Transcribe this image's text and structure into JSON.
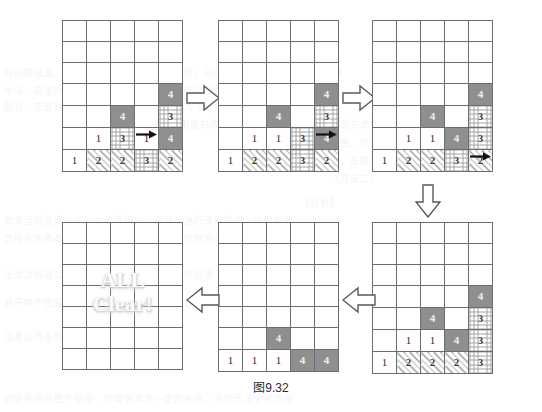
{
  "figure": {
    "caption_cjk": "图",
    "caption_number": "9.32",
    "all_clear_text": "ALL\nClear!"
  },
  "grid_spec": {
    "columns": 5,
    "rows": 7,
    "cell_types": [
      "empty",
      "plain",
      "solid",
      "diag",
      "cross"
    ]
  },
  "panels": [
    {
      "id": "panel-1",
      "name": "step-1-initial",
      "rows": [
        [
          {
            "t": "empty",
            "v": ""
          },
          {
            "t": "empty",
            "v": ""
          },
          {
            "t": "empty",
            "v": ""
          },
          {
            "t": "empty",
            "v": ""
          },
          {
            "t": "empty",
            "v": ""
          }
        ],
        [
          {
            "t": "empty",
            "v": ""
          },
          {
            "t": "empty",
            "v": ""
          },
          {
            "t": "empty",
            "v": ""
          },
          {
            "t": "empty",
            "v": ""
          },
          {
            "t": "empty",
            "v": ""
          }
        ],
        [
          {
            "t": "empty",
            "v": ""
          },
          {
            "t": "empty",
            "v": ""
          },
          {
            "t": "empty",
            "v": ""
          },
          {
            "t": "empty",
            "v": ""
          },
          {
            "t": "empty",
            "v": ""
          }
        ],
        [
          {
            "t": "empty",
            "v": ""
          },
          {
            "t": "empty",
            "v": ""
          },
          {
            "t": "empty",
            "v": ""
          },
          {
            "t": "empty",
            "v": ""
          },
          {
            "t": "solid",
            "v": "4"
          }
        ],
        [
          {
            "t": "empty",
            "v": ""
          },
          {
            "t": "empty",
            "v": ""
          },
          {
            "t": "solid",
            "v": "4"
          },
          {
            "t": "empty",
            "v": ""
          },
          {
            "t": "cross",
            "v": "3"
          }
        ],
        [
          {
            "t": "empty",
            "v": ""
          },
          {
            "t": "plain",
            "v": "1"
          },
          {
            "t": "cross",
            "v": "3"
          },
          {
            "t": "plain",
            "v": "1"
          },
          {
            "t": "solid",
            "v": "4"
          }
        ],
        [
          {
            "t": "plain",
            "v": "1"
          },
          {
            "t": "diag",
            "v": "2"
          },
          {
            "t": "diag",
            "v": "2"
          },
          {
            "t": "cross",
            "v": "3"
          },
          {
            "t": "diag",
            "v": "2"
          }
        ]
      ],
      "arrow": {
        "type": "right-motion",
        "row": 5,
        "col": 3
      }
    },
    {
      "id": "panel-2",
      "name": "step-2",
      "rows": [
        [
          {
            "t": "empty",
            "v": ""
          },
          {
            "t": "empty",
            "v": ""
          },
          {
            "t": "empty",
            "v": ""
          },
          {
            "t": "empty",
            "v": ""
          },
          {
            "t": "empty",
            "v": ""
          }
        ],
        [
          {
            "t": "empty",
            "v": ""
          },
          {
            "t": "empty",
            "v": ""
          },
          {
            "t": "empty",
            "v": ""
          },
          {
            "t": "empty",
            "v": ""
          },
          {
            "t": "empty",
            "v": ""
          }
        ],
        [
          {
            "t": "empty",
            "v": ""
          },
          {
            "t": "empty",
            "v": ""
          },
          {
            "t": "empty",
            "v": ""
          },
          {
            "t": "empty",
            "v": ""
          },
          {
            "t": "empty",
            "v": ""
          }
        ],
        [
          {
            "t": "empty",
            "v": ""
          },
          {
            "t": "empty",
            "v": ""
          },
          {
            "t": "empty",
            "v": ""
          },
          {
            "t": "empty",
            "v": ""
          },
          {
            "t": "solid",
            "v": "4"
          }
        ],
        [
          {
            "t": "empty",
            "v": ""
          },
          {
            "t": "empty",
            "v": ""
          },
          {
            "t": "solid",
            "v": "4"
          },
          {
            "t": "empty",
            "v": ""
          },
          {
            "t": "cross",
            "v": "3"
          }
        ],
        [
          {
            "t": "empty",
            "v": ""
          },
          {
            "t": "plain",
            "v": "1"
          },
          {
            "t": "plain",
            "v": "1"
          },
          {
            "t": "cross",
            "v": "3"
          },
          {
            "t": "solid",
            "v": "4"
          }
        ],
        [
          {
            "t": "plain",
            "v": "1"
          },
          {
            "t": "diag",
            "v": "2"
          },
          {
            "t": "diag",
            "v": "2"
          },
          {
            "t": "cross",
            "v": "3"
          },
          {
            "t": "diag",
            "v": "2"
          }
        ]
      ],
      "arrow": {
        "type": "right-motion",
        "row": 5,
        "col": 4
      }
    },
    {
      "id": "panel-3",
      "name": "step-3",
      "rows": [
        [
          {
            "t": "empty",
            "v": ""
          },
          {
            "t": "empty",
            "v": ""
          },
          {
            "t": "empty",
            "v": ""
          },
          {
            "t": "empty",
            "v": ""
          },
          {
            "t": "empty",
            "v": ""
          }
        ],
        [
          {
            "t": "empty",
            "v": ""
          },
          {
            "t": "empty",
            "v": ""
          },
          {
            "t": "empty",
            "v": ""
          },
          {
            "t": "empty",
            "v": ""
          },
          {
            "t": "empty",
            "v": ""
          }
        ],
        [
          {
            "t": "empty",
            "v": ""
          },
          {
            "t": "empty",
            "v": ""
          },
          {
            "t": "empty",
            "v": ""
          },
          {
            "t": "empty",
            "v": ""
          },
          {
            "t": "empty",
            "v": ""
          }
        ],
        [
          {
            "t": "empty",
            "v": ""
          },
          {
            "t": "empty",
            "v": ""
          },
          {
            "t": "empty",
            "v": ""
          },
          {
            "t": "empty",
            "v": ""
          },
          {
            "t": "solid",
            "v": "4"
          }
        ],
        [
          {
            "t": "empty",
            "v": ""
          },
          {
            "t": "empty",
            "v": ""
          },
          {
            "t": "solid",
            "v": "4"
          },
          {
            "t": "empty",
            "v": ""
          },
          {
            "t": "cross",
            "v": "3"
          }
        ],
        [
          {
            "t": "empty",
            "v": ""
          },
          {
            "t": "plain",
            "v": "1"
          },
          {
            "t": "plain",
            "v": "1"
          },
          {
            "t": "solid",
            "v": "4"
          },
          {
            "t": "cross",
            "v": "3"
          }
        ],
        [
          {
            "t": "plain",
            "v": "1"
          },
          {
            "t": "diag",
            "v": "2"
          },
          {
            "t": "diag",
            "v": "2"
          },
          {
            "t": "cross",
            "v": "3"
          },
          {
            "t": "diag",
            "v": "2"
          }
        ]
      ],
      "arrow": {
        "type": "right-motion",
        "row": 6,
        "col": 4
      }
    },
    {
      "id": "panel-4",
      "name": "step-4",
      "rows": [
        [
          {
            "t": "empty",
            "v": ""
          },
          {
            "t": "empty",
            "v": ""
          },
          {
            "t": "empty",
            "v": ""
          },
          {
            "t": "empty",
            "v": ""
          },
          {
            "t": "empty",
            "v": ""
          }
        ],
        [
          {
            "t": "empty",
            "v": ""
          },
          {
            "t": "empty",
            "v": ""
          },
          {
            "t": "empty",
            "v": ""
          },
          {
            "t": "empty",
            "v": ""
          },
          {
            "t": "empty",
            "v": ""
          }
        ],
        [
          {
            "t": "empty",
            "v": ""
          },
          {
            "t": "empty",
            "v": ""
          },
          {
            "t": "empty",
            "v": ""
          },
          {
            "t": "empty",
            "v": ""
          },
          {
            "t": "empty",
            "v": ""
          }
        ],
        [
          {
            "t": "empty",
            "v": ""
          },
          {
            "t": "empty",
            "v": ""
          },
          {
            "t": "empty",
            "v": ""
          },
          {
            "t": "empty",
            "v": ""
          },
          {
            "t": "solid",
            "v": "4"
          }
        ],
        [
          {
            "t": "empty",
            "v": ""
          },
          {
            "t": "empty",
            "v": ""
          },
          {
            "t": "solid",
            "v": "4"
          },
          {
            "t": "empty",
            "v": ""
          },
          {
            "t": "cross",
            "v": "3"
          }
        ],
        [
          {
            "t": "empty",
            "v": ""
          },
          {
            "t": "plain",
            "v": "1"
          },
          {
            "t": "plain",
            "v": "1"
          },
          {
            "t": "solid",
            "v": "4"
          },
          {
            "t": "cross",
            "v": "3"
          }
        ],
        [
          {
            "t": "plain",
            "v": "1"
          },
          {
            "t": "diag",
            "v": "2"
          },
          {
            "t": "diag",
            "v": "2"
          },
          {
            "t": "diag",
            "v": "2"
          },
          {
            "t": "cross",
            "v": "3"
          }
        ]
      ],
      "arrow": null
    },
    {
      "id": "panel-5",
      "name": "step-5",
      "rows": [
        [
          {
            "t": "empty",
            "v": ""
          },
          {
            "t": "empty",
            "v": ""
          },
          {
            "t": "empty",
            "v": ""
          },
          {
            "t": "empty",
            "v": ""
          },
          {
            "t": "empty",
            "v": ""
          }
        ],
        [
          {
            "t": "empty",
            "v": ""
          },
          {
            "t": "empty",
            "v": ""
          },
          {
            "t": "empty",
            "v": ""
          },
          {
            "t": "empty",
            "v": ""
          },
          {
            "t": "empty",
            "v": ""
          }
        ],
        [
          {
            "t": "empty",
            "v": ""
          },
          {
            "t": "empty",
            "v": ""
          },
          {
            "t": "empty",
            "v": ""
          },
          {
            "t": "empty",
            "v": ""
          },
          {
            "t": "empty",
            "v": ""
          }
        ],
        [
          {
            "t": "empty",
            "v": ""
          },
          {
            "t": "empty",
            "v": ""
          },
          {
            "t": "empty",
            "v": ""
          },
          {
            "t": "empty",
            "v": ""
          },
          {
            "t": "empty",
            "v": ""
          }
        ],
        [
          {
            "t": "empty",
            "v": ""
          },
          {
            "t": "empty",
            "v": ""
          },
          {
            "t": "empty",
            "v": ""
          },
          {
            "t": "empty",
            "v": ""
          },
          {
            "t": "empty",
            "v": ""
          }
        ],
        [
          {
            "t": "empty",
            "v": ""
          },
          {
            "t": "empty",
            "v": ""
          },
          {
            "t": "solid",
            "v": "4"
          },
          {
            "t": "empty",
            "v": ""
          },
          {
            "t": "empty",
            "v": ""
          }
        ],
        [
          {
            "t": "plain",
            "v": "1"
          },
          {
            "t": "plain",
            "v": "1"
          },
          {
            "t": "plain",
            "v": "1"
          },
          {
            "t": "solid",
            "v": "4"
          },
          {
            "t": "solid",
            "v": "4"
          }
        ]
      ],
      "arrow": null
    },
    {
      "id": "panel-6",
      "name": "step-6-all-clear",
      "rows": [
        [
          {
            "t": "empty",
            "v": ""
          },
          {
            "t": "empty",
            "v": ""
          },
          {
            "t": "empty",
            "v": ""
          },
          {
            "t": "empty",
            "v": ""
          },
          {
            "t": "empty",
            "v": ""
          }
        ],
        [
          {
            "t": "empty",
            "v": ""
          },
          {
            "t": "empty",
            "v": ""
          },
          {
            "t": "empty",
            "v": ""
          },
          {
            "t": "empty",
            "v": ""
          },
          {
            "t": "empty",
            "v": ""
          }
        ],
        [
          {
            "t": "empty",
            "v": ""
          },
          {
            "t": "empty",
            "v": ""
          },
          {
            "t": "empty",
            "v": ""
          },
          {
            "t": "empty",
            "v": ""
          },
          {
            "t": "empty",
            "v": ""
          }
        ],
        [
          {
            "t": "empty",
            "v": ""
          },
          {
            "t": "empty",
            "v": ""
          },
          {
            "t": "empty",
            "v": ""
          },
          {
            "t": "empty",
            "v": ""
          },
          {
            "t": "empty",
            "v": ""
          }
        ],
        [
          {
            "t": "empty",
            "v": ""
          },
          {
            "t": "empty",
            "v": ""
          },
          {
            "t": "empty",
            "v": ""
          },
          {
            "t": "empty",
            "v": ""
          },
          {
            "t": "empty",
            "v": ""
          }
        ],
        [
          {
            "t": "empty",
            "v": ""
          },
          {
            "t": "empty",
            "v": ""
          },
          {
            "t": "empty",
            "v": ""
          },
          {
            "t": "empty",
            "v": ""
          },
          {
            "t": "empty",
            "v": ""
          }
        ],
        [
          {
            "t": "empty",
            "v": ""
          },
          {
            "t": "empty",
            "v": ""
          },
          {
            "t": "empty",
            "v": ""
          },
          {
            "t": "empty",
            "v": ""
          },
          {
            "t": "empty",
            "v": ""
          }
        ]
      ],
      "arrow": null
    }
  ],
  "flow_arrows": [
    {
      "id": "flow-1",
      "direction": "right",
      "from": "panel-1",
      "to": "panel-2"
    },
    {
      "id": "flow-2",
      "direction": "right",
      "from": "panel-2",
      "to": "panel-3"
    },
    {
      "id": "flow-3",
      "direction": "down",
      "from": "panel-3",
      "to": "panel-4"
    },
    {
      "id": "flow-4",
      "direction": "left",
      "from": "panel-4",
      "to": "panel-5"
    },
    {
      "id": "flow-5",
      "direction": "left",
      "from": "panel-5",
      "to": "panel-6"
    }
  ],
  "bleed_text": [
    {
      "x": 4,
      "y": 66,
      "s": "的问题就是，由此可知，为了保证其正确性，必须保证所有的元素都满足条件"
    },
    {
      "x": 4,
      "y": 84,
      "s": "中间，这里所说的合并，是指将两个相邻的区间合并成一个更大的区间"
    },
    {
      "x": 4,
      "y": 100,
      "s": "部分，在这种情况下，算法的时间复杂度为 O(n)，空间复杂度为 O(1)"
    },
    {
      "x": 150,
      "y": 118,
      "s": "可以采用递归的方式实现，也可以采用迭代的方式实现"
    },
    {
      "x": 220,
      "y": 136,
      "s": "合并后的区间仍然保持有序性，因此可以继续合并"
    },
    {
      "x": 300,
      "y": 154,
      "s": "可以看出，在最坏情况下需要"
    },
    {
      "x": 330,
      "y": 172,
      "s": "（方法二）"
    },
    {
      "x": 300,
      "y": 196,
      "s": "【分析】"
    },
    {
      "x": 4,
      "y": 214,
      "s": "如果当前元素与下一个元素相同，则可以进行消除操作，继续判断"
    },
    {
      "x": 4,
      "y": 232,
      "s": "当所有元素都被消除之后，游戏结束，此时称为全部消除"
    },
    {
      "x": 4,
      "y": 268,
      "s": "上述过程可以用一个循环来实现，每次循环处理一个元素"
    },
    {
      "x": 4,
      "y": 296,
      "s": "对于每个位置，判断其是否可以与相邻位置合并，若可以则合并"
    },
    {
      "x": 4,
      "y": 330,
      "s": "注意边界条件的处理，避免数组越界"
    },
    {
      "x": 4,
      "y": 392,
      "s": "如果要消除整个盘面，则需要满足一定的条件，否则无法全部消除"
    }
  ]
}
